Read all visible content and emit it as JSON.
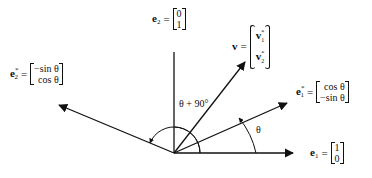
{
  "diagram": {
    "origin": [
      174,
      153
    ],
    "vectors": {
      "e1": {
        "name": "e",
        "sub": "1",
        "sup": "",
        "matrix": [
          "1",
          "0"
        ],
        "tip": [
          293,
          153
        ]
      },
      "e2": {
        "name": "e",
        "sub": "2",
        "sup": "",
        "matrix": [
          "0",
          "1"
        ],
        "axis_top": [
          174,
          52
        ]
      },
      "e1_star": {
        "name": "e",
        "sub": "1",
        "sup": "*",
        "matrix": [
          "cos θ",
          "−sin θ"
        ],
        "tip": [
          287,
          103
        ]
      },
      "e2_star": {
        "name": "e",
        "sub": "2",
        "sup": "*",
        "matrix": [
          "−sin θ",
          "cos θ"
        ],
        "tip": [
          59,
          105
        ]
      },
      "v": {
        "name": "v",
        "components": [
          "v",
          "v"
        ],
        "component_subs": [
          "1",
          "2"
        ],
        "component_sup": "*",
        "tip": [
          245,
          62
        ]
      }
    },
    "angles": {
      "theta": "θ",
      "theta_plus_90": "θ + 90°"
    },
    "equals": "="
  }
}
